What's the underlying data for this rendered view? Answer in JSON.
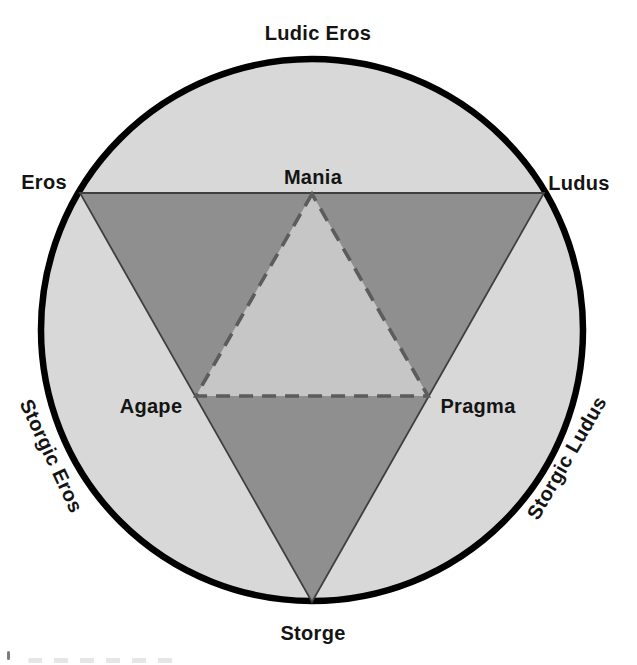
{
  "figure": {
    "labels": {
      "top_arc": "Ludic Eros",
      "left_vertex": "Eros",
      "inner_apex": "Mania",
      "right_vertex": "Ludus",
      "inner_left": "Agape",
      "inner_right": "Pragma",
      "left_arc": "Storgic Eros",
      "right_arc": "Storgic Ludus",
      "bottom_vertex": "Storge"
    },
    "colors": {
      "background": "#ffffff",
      "circle_fill": "#d8d8d8",
      "circle_stroke": "#000000",
      "outer_triangle_fill": "#8f8f8f",
      "outer_triangle_stroke": "#3f3f3f",
      "inner_triangle_fill": "#c6c6c6",
      "inner_triangle_stroke": "#5c5c5c",
      "label_text": "#141414"
    }
  }
}
